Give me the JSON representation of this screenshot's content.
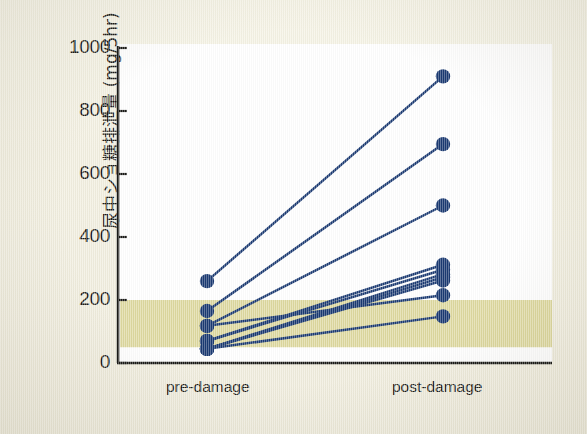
{
  "figure": {
    "background_color": "#f2efe0",
    "plot_background_color": "#ffffff"
  },
  "chart_data": {
    "type": "line",
    "subtype": "paired-slope-chart",
    "title": "",
    "xlabel": "",
    "ylabel": "尿中ショ糖排泄量 (mg/5hr)",
    "categories": [
      "pre-damage",
      "post-damage"
    ],
    "xtick_labels": [
      "pre-damage",
      "post-damage"
    ],
    "ytick_labels": [
      "0",
      "200",
      "400",
      "600",
      "800",
      "1000"
    ],
    "yticks": [
      0,
      200,
      400,
      600,
      800,
      1000
    ],
    "ylim": [
      0,
      1000
    ],
    "grid": false,
    "legend": false,
    "marker": "filled-circle",
    "marker_color": "#1b3a72",
    "line_color": "#1b3a72",
    "reference_band": {
      "label": "",
      "from": 50,
      "to": 200,
      "color": "#dcd79a"
    },
    "series": [
      {
        "name": "subject-1",
        "values": [
          260,
          910
        ]
      },
      {
        "name": "subject-2",
        "values": [
          165,
          695
        ]
      },
      {
        "name": "subject-3",
        "values": [
          118,
          500
        ]
      },
      {
        "name": "subject-4",
        "values": [
          70,
          312
        ]
      },
      {
        "name": "subject-5",
        "values": [
          70,
          296
        ]
      },
      {
        "name": "subject-6",
        "values": [
          45,
          282
        ]
      },
      {
        "name": "subject-7",
        "values": [
          45,
          272
        ]
      },
      {
        "name": "subject-8",
        "values": [
          45,
          262
        ]
      },
      {
        "name": "subject-9",
        "values": [
          118,
          215
        ]
      },
      {
        "name": "subject-10",
        "values": [
          45,
          148
        ]
      }
    ]
  },
  "axis": {
    "y_unit": "mg/5hr"
  }
}
